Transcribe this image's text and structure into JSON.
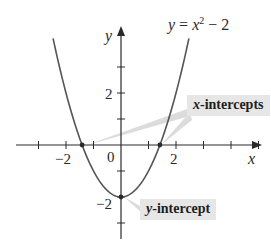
{
  "chart_data": {
    "type": "line",
    "title": "",
    "equation": "y = x^2 - 2",
    "equation_parts": {
      "lhs": "y",
      "eq": " = ",
      "var": "x",
      "exp": "2",
      "rest": " − 2"
    },
    "xlabel": "x",
    "ylabel": "y",
    "xlim": [
      -3.8,
      5.4
    ],
    "ylim": [
      -3.6,
      4.0
    ],
    "x_ticks": [
      -3,
      -2,
      -1,
      0,
      1,
      2,
      3,
      4,
      5
    ],
    "y_ticks": [
      -3,
      -2,
      -1,
      1,
      2,
      3
    ],
    "x_tick_labels": [
      {
        "value": -2,
        "text": "−2"
      },
      {
        "value": 2,
        "text": "2"
      }
    ],
    "y_tick_labels": [
      {
        "value": 2,
        "text": "2"
      },
      {
        "value": -2,
        "text": "−2"
      }
    ],
    "origin_label": "0",
    "grid": false,
    "series": [
      {
        "name": "y = x^2 - 2",
        "x": [
          -2.5,
          -2.0,
          -1.5,
          -1.0,
          -0.5,
          0.0,
          0.5,
          1.0,
          1.5,
          2.0,
          2.5
        ],
        "values": [
          4.25,
          2.0,
          0.25,
          -1.0,
          -1.75,
          -2.0,
          -1.75,
          -1.0,
          0.25,
          2.0,
          4.25
        ],
        "color": "#555555"
      }
    ],
    "points": [
      {
        "name": "x-intercept-left",
        "x": -1.414,
        "y": 0
      },
      {
        "name": "x-intercept-right",
        "x": 1.414,
        "y": 0
      },
      {
        "name": "y-intercept",
        "x": 0,
        "y": -2
      }
    ],
    "annotations": [
      {
        "text": "x-intercepts",
        "var": "x",
        "suffix": "-intercepts"
      },
      {
        "text": "y-intercept",
        "var": "y",
        "suffix": "-intercept"
      }
    ]
  },
  "colors": {
    "axis": "#2a2a2a",
    "curve": "#555555",
    "callout_bg": "#e6e6e6",
    "leader": "#dcdcdc"
  }
}
